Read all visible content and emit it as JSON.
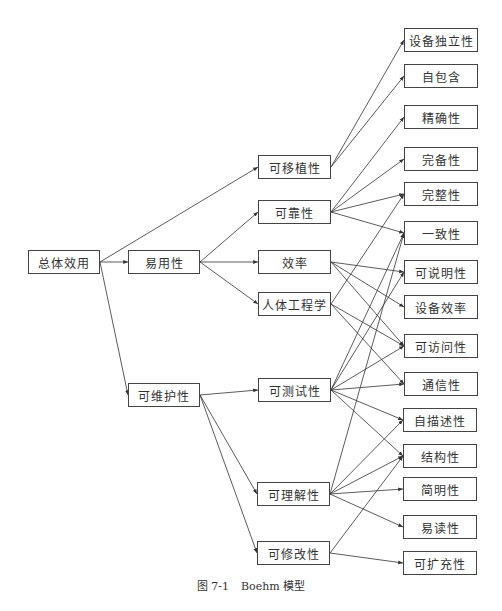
{
  "diagram": {
    "title": "Boehm 模型",
    "caption": {
      "figure_number": "图 7-1",
      "text": "Boehm 模型"
    },
    "nodes": [
      {
        "id": "zongti",
        "label": "总体效用",
        "x": 28,
        "y": 250,
        "w": 72,
        "h": 24
      },
      {
        "id": "yiyong",
        "label": "易用性",
        "x": 128,
        "y": 250,
        "w": 72,
        "h": 24
      },
      {
        "id": "weihu",
        "label": "可维护性",
        "x": 128,
        "y": 383,
        "w": 72,
        "h": 24
      },
      {
        "id": "yizhi",
        "label": "可移植性",
        "x": 258,
        "y": 155,
        "w": 73,
        "h": 24
      },
      {
        "id": "kekao",
        "label": "可靠性",
        "x": 258,
        "y": 200,
        "w": 73,
        "h": 24
      },
      {
        "id": "xiaolv",
        "label": "效率",
        "x": 258,
        "y": 250,
        "w": 73,
        "h": 24
      },
      {
        "id": "renti",
        "label": "人体工程学",
        "x": 258,
        "y": 292,
        "w": 73,
        "h": 24
      },
      {
        "id": "ceshi",
        "label": "可测试性",
        "x": 258,
        "y": 378,
        "w": 73,
        "h": 24
      },
      {
        "id": "lijie",
        "label": "可理解性",
        "x": 257,
        "y": 482,
        "w": 73,
        "h": 24
      },
      {
        "id": "xiugai",
        "label": "可修改性",
        "x": 257,
        "y": 541,
        "w": 73,
        "h": 24
      },
      {
        "id": "sbdl",
        "label": "设备独立性",
        "x": 404,
        "y": 28,
        "w": 74,
        "h": 24
      },
      {
        "id": "zbh",
        "label": "自包含",
        "x": 404,
        "y": 64,
        "w": 74,
        "h": 24
      },
      {
        "id": "jqx",
        "label": "精确性",
        "x": 404,
        "y": 105,
        "w": 74,
        "h": 24
      },
      {
        "id": "wbx",
        "label": "完备性",
        "x": 404,
        "y": 147,
        "w": 74,
        "h": 24
      },
      {
        "id": "wzx",
        "label": "完整性",
        "x": 404,
        "y": 182,
        "w": 74,
        "h": 24
      },
      {
        "id": "yzx",
        "label": "一致性",
        "x": 404,
        "y": 221,
        "w": 74,
        "h": 24
      },
      {
        "id": "ksm",
        "label": "可说明性",
        "x": 404,
        "y": 260,
        "w": 74,
        "h": 24
      },
      {
        "id": "sbxl",
        "label": "设备效率",
        "x": 404,
        "y": 295,
        "w": 74,
        "h": 24
      },
      {
        "id": "kfw",
        "label": "可访问性",
        "x": 404,
        "y": 334,
        "w": 74,
        "h": 24
      },
      {
        "id": "txx",
        "label": "通信性",
        "x": 404,
        "y": 372,
        "w": 74,
        "h": 24
      },
      {
        "id": "zms",
        "label": "自描述性",
        "x": 403,
        "y": 408,
        "w": 74,
        "h": 24
      },
      {
        "id": "jgx",
        "label": "结构性",
        "x": 403,
        "y": 444,
        "w": 74,
        "h": 24
      },
      {
        "id": "jmx",
        "label": "简明性",
        "x": 403,
        "y": 477,
        "w": 74,
        "h": 24
      },
      {
        "id": "ydx",
        "label": "易读性",
        "x": 403,
        "y": 515,
        "w": 74,
        "h": 24
      },
      {
        "id": "kkc",
        "label": "可扩充性",
        "x": 403,
        "y": 551,
        "w": 74,
        "h": 24
      }
    ],
    "edges": [
      [
        "zongti",
        "yizhi"
      ],
      [
        "zongti",
        "yiyong"
      ],
      [
        "zongti",
        "weihu"
      ],
      [
        "yiyong",
        "kekao"
      ],
      [
        "yiyong",
        "xiaolv"
      ],
      [
        "yiyong",
        "renti"
      ],
      [
        "weihu",
        "ceshi"
      ],
      [
        "weihu",
        "lijie"
      ],
      [
        "weihu",
        "xiugai"
      ],
      [
        "yizhi",
        "sbdl"
      ],
      [
        "yizhi",
        "zbh"
      ],
      [
        "kekao",
        "jqx"
      ],
      [
        "kekao",
        "wbx"
      ],
      [
        "kekao",
        "wzx"
      ],
      [
        "kekao",
        "yzx"
      ],
      [
        "xiaolv",
        "ksm"
      ],
      [
        "xiaolv",
        "sbxl"
      ],
      [
        "xiaolv",
        "kfw"
      ],
      [
        "renti",
        "wzx"
      ],
      [
        "renti",
        "kfw"
      ],
      [
        "renti",
        "txx"
      ],
      [
        "ceshi",
        "yzx"
      ],
      [
        "ceshi",
        "ksm"
      ],
      [
        "ceshi",
        "kfw"
      ],
      [
        "ceshi",
        "txx"
      ],
      [
        "ceshi",
        "zms"
      ],
      [
        "ceshi",
        "jgx"
      ],
      [
        "lijie",
        "yzx"
      ],
      [
        "lijie",
        "zms"
      ],
      [
        "lijie",
        "jgx"
      ],
      [
        "lijie",
        "jmx"
      ],
      [
        "lijie",
        "ydx"
      ],
      [
        "xiugai",
        "jgx"
      ],
      [
        "xiugai",
        "kkc"
      ]
    ],
    "colors": {
      "line": "#333333",
      "border": "#444444",
      "text": "#333333",
      "background": "#ffffff"
    }
  }
}
